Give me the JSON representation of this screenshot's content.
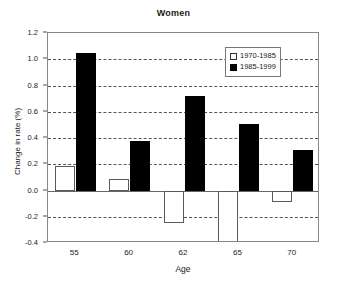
{
  "chart_data": {
    "type": "bar",
    "title": "Women",
    "xlabel": "Age",
    "ylabel": "Change in rate (%)",
    "categories": [
      "55",
      "60",
      "62",
      "65",
      "70"
    ],
    "series": [
      {
        "name": "1970-1985",
        "style": "open",
        "color": "#ffffff",
        "edge_color": "#5a5a5a",
        "values": [
          0.19,
          0.09,
          -0.25,
          -0.39,
          -0.09
        ]
      },
      {
        "name": "1985-1999",
        "style": "filled",
        "color": "#000000",
        "edge_color": "#000000",
        "values": [
          1.05,
          0.38,
          0.72,
          0.51,
          0.31
        ]
      }
    ],
    "ylim": [
      -0.4,
      1.2
    ],
    "ytick_values": [
      1.2,
      1.0,
      0.8,
      0.6,
      0.4,
      0.2,
      0.0,
      -0.2,
      -0.4
    ],
    "ytick_labels": [
      "1.2",
      "1.0",
      "0.8",
      "0.6",
      "0.4",
      "0.2",
      "0.0",
      "-0.2",
      "-0.4"
    ],
    "gridlines_at": [
      1.0,
      0.8,
      0.6,
      0.4,
      0.2,
      -0.2
    ],
    "grid": true,
    "grid_style": "dashed",
    "zero_line": 0.0,
    "legend_position": "upper right",
    "legend_entries": [
      "1970-1985",
      "1985-1999"
    ]
  }
}
